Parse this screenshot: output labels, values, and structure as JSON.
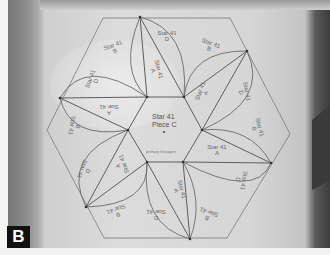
{
  "figure": {
    "panel_label": "B"
  },
  "center": {
    "title": "Star 41",
    "piece": "Piece C",
    "caption": "primary hexagon"
  },
  "labels": [
    {
      "text": "Star 41",
      "sub": "D",
      "x": 166,
      "y": 36,
      "rot": 0
    },
    {
      "text": "Star 41",
      "sub": "B",
      "x": 113,
      "y": 48,
      "rot": -20
    },
    {
      "text": "Star 41",
      "sub": "B",
      "x": 209,
      "y": 46,
      "rot": 20
    },
    {
      "text": "Star 41",
      "sub": "D",
      "x": 92,
      "y": 80,
      "rot": -70
    },
    {
      "text": "Star 41",
      "sub": "A",
      "x": 155,
      "y": 70,
      "rot": 75
    },
    {
      "text": "Star 41",
      "sub": "A",
      "x": 202,
      "y": 92,
      "rot": -70
    },
    {
      "text": "Star 41",
      "sub": "D",
      "x": 243,
      "y": 92,
      "rot": 80
    },
    {
      "text": "A",
      "sub": "Star 41",
      "x": 108,
      "y": 110,
      "rot": 180
    },
    {
      "text": "Star 41",
      "sub": "B",
      "x": 256,
      "y": 128,
      "rot": 75
    },
    {
      "text": "B",
      "sub": "Star 41",
      "x": 74,
      "y": 126,
      "rot": 100
    },
    {
      "text": "Star 41",
      "sub": "A",
      "x": 216,
      "y": 150,
      "rot": 0
    },
    {
      "text": "A",
      "sub": "Star 41",
      "x": 120,
      "y": 165,
      "rot": -110
    },
    {
      "text": "D",
      "sub": "Star 41",
      "x": 84,
      "y": 170,
      "rot": 110
    },
    {
      "text": "Star 41",
      "sub": "A",
      "x": 178,
      "y": 190,
      "rot": 75
    },
    {
      "text": "Star 41",
      "sub": "D",
      "x": 240,
      "y": 180,
      "rot": 100
    },
    {
      "text": "B",
      "sub": "Star 41",
      "x": 116,
      "y": 212,
      "rot": 160
    },
    {
      "text": "D",
      "sub": "Star 41",
      "x": 155,
      "y": 215,
      "rot": 180
    },
    {
      "text": "B",
      "sub": "Star 41",
      "x": 207,
      "y": 215,
      "rot": -160
    }
  ],
  "colors": {
    "line": "#6b6b6b",
    "paper": "#d9d9d9",
    "badge_bg": "#111111",
    "badge_fg": "#ffffff"
  }
}
